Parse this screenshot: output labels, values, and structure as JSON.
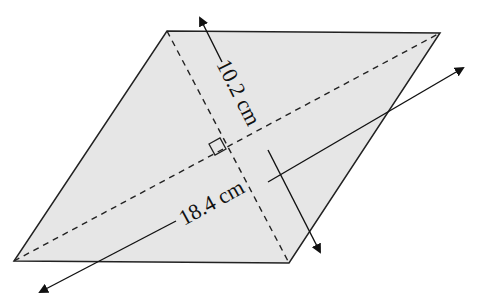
{
  "figure": {
    "shape": "rhombus",
    "fill_color": "#e6e6e6",
    "stroke_color": "#222222",
    "vertices": {
      "top_left": [
        167,
        31
      ],
      "top_right": [
        440,
        33
      ],
      "bottom_right": [
        289,
        263
      ],
      "bottom_left": [
        14,
        261
      ]
    }
  },
  "diagonals": {
    "short": {
      "label": "10.2 cm",
      "style": "dashed"
    },
    "long": {
      "label": "18.4 cm",
      "style": "dashed"
    }
  },
  "right_angle_marker": true
}
